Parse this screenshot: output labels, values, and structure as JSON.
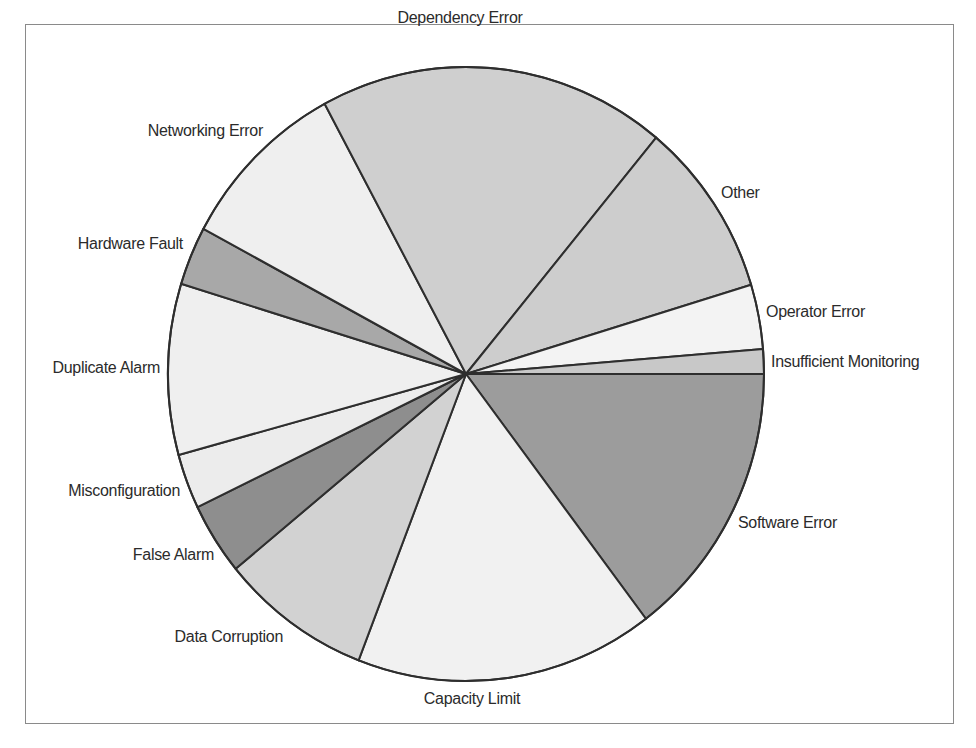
{
  "chart_data": {
    "type": "pie",
    "title": "",
    "start_angle_deg": 0,
    "direction": "clockwise",
    "legend": "none (direct labels)",
    "slices": [
      {
        "label": "Software Error",
        "value": 14.7,
        "color": "#9c9c9c"
      },
      {
        "label": "Capacity Limit",
        "value": 16.2,
        "color": "#f1f1f1"
      },
      {
        "label": "Data Corruption",
        "value": 8.2,
        "color": "#d2d2d2"
      },
      {
        "label": "False Alarm",
        "value": 3.8,
        "color": "#8e8e8e"
      },
      {
        "label": "Misconfiguration",
        "value": 2.9,
        "color": "#ececec"
      },
      {
        "label": "Duplicate Alarm",
        "value": 9.0,
        "color": "#efefef"
      },
      {
        "label": "Hardware Fault",
        "value": 3.1,
        "color": "#a8a8a8"
      },
      {
        "label": "Networking Error",
        "value": 9.3,
        "color": "#efefef"
      },
      {
        "label": "Dependency Error",
        "value": 18.9,
        "color": "#cfcfcf"
      },
      {
        "label": "Other",
        "value": 9.3,
        "color": "#cdcdcd"
      },
      {
        "label": "Operator Error",
        "value": 3.4,
        "color": "#f3f3f3"
      },
      {
        "label": "Insufficient Monitoring",
        "value": 1.3,
        "color": "#c8c8c8"
      }
    ]
  },
  "labels": [
    {
      "text": "Software Error",
      "x": 738,
      "y": 528,
      "anchor": "start"
    },
    {
      "text": "Capacity Limit",
      "x": 472,
      "y": 704,
      "anchor": "middle"
    },
    {
      "text": "Data Corruption",
      "x": 283,
      "y": 642,
      "anchor": "end"
    },
    {
      "text": "False Alarm",
      "x": 214,
      "y": 560,
      "anchor": "end"
    },
    {
      "text": "Misconfiguration",
      "x": 180,
      "y": 496,
      "anchor": "end"
    },
    {
      "text": "Duplicate Alarm",
      "x": 160,
      "y": 373,
      "anchor": "end"
    },
    {
      "text": "Hardware Fault",
      "x": 183,
      "y": 249,
      "anchor": "end"
    },
    {
      "text": "Networking Error",
      "x": 263,
      "y": 136,
      "anchor": "end"
    },
    {
      "text": "Dependency Error",
      "x": 460,
      "y": 23,
      "anchor": "middle"
    },
    {
      "text": "Other",
      "x": 721,
      "y": 198,
      "anchor": "start"
    },
    {
      "text": "Operator Error",
      "x": 766,
      "y": 317,
      "anchor": "start"
    },
    {
      "text": "Insufficient Monitoring",
      "x": 771,
      "y": 367,
      "anchor": "start"
    }
  ],
  "geometry": {
    "cx": 466,
    "cy": 374,
    "rx": 298,
    "ry": 307
  }
}
